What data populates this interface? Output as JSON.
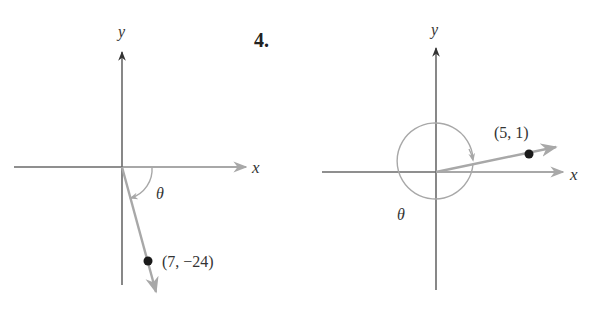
{
  "figures": [
    {
      "problem_number": "",
      "x_axis_label": "x",
      "y_axis_label": "y",
      "angle_label": "θ",
      "point": {
        "x": 7,
        "y": -24,
        "label": "(7, −24)"
      },
      "angle_direction": "clockwise",
      "angle_description": "negative angle from positive x-axis to terminal side in quadrant IV"
    },
    {
      "problem_number": "4.",
      "x_axis_label": "x",
      "y_axis_label": "y",
      "angle_label": "θ",
      "point": {
        "x": 5,
        "y": 1,
        "label": "(5, 1)"
      },
      "angle_direction": "clockwise",
      "angle_description": "negative angle more than one full turn... drawn as near-full clockwise rotation to terminal side in quadrant I"
    }
  ],
  "colors": {
    "axis": "#6a6a6a",
    "ray": "#a8a8a8",
    "point": "#1a1a1a",
    "text": "#333333"
  }
}
